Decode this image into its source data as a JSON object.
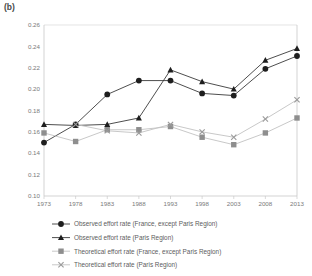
{
  "figure": {
    "panel_label": "(b)"
  },
  "chart_data": {
    "type": "line",
    "title": "",
    "subtitle": "",
    "xlabel": "",
    "ylabel": "",
    "grid": false,
    "legend_position": "bottom",
    "x": [
      1973,
      1978,
      1983,
      1988,
      1993,
      1998,
      2003,
      2008,
      2013
    ],
    "categories": [
      "1973",
      "1978",
      "1983",
      "1988",
      "1993",
      "1998",
      "2003",
      "2008",
      "2013"
    ],
    "xtick_labels": [
      "1973",
      "1978",
      "1983",
      "1988",
      "1993",
      "1998",
      "2003",
      "2008",
      "2013"
    ],
    "ytick_labels": [
      "0.26",
      "0.24",
      "0.22",
      "0.20",
      "0.18",
      "0.16",
      "0.14",
      "0.12",
      "0.10"
    ],
    "ytick_values": [
      0.26,
      0.24,
      0.22,
      0.2,
      0.18,
      0.16,
      0.14,
      0.12,
      0.1
    ],
    "ylim": [
      0.1,
      0.26
    ],
    "xlim": [
      1973,
      2013
    ],
    "series": [
      {
        "name": "Observed effort rate (France, except Paris Region)",
        "marker": "circle",
        "color": "#1e1e1e",
        "line_color": "#3a3a3a",
        "values": [
          0.15,
          0.167,
          0.195,
          0.208,
          0.208,
          0.196,
          0.194,
          0.219,
          0.231
        ]
      },
      {
        "name": "Observed effort rate (Paris Region)",
        "marker": "triangle",
        "color": "#1e1e1e",
        "line_color": "#3a3a3a",
        "values": [
          0.167,
          0.166,
          0.167,
          0.173,
          0.218,
          0.207,
          0.2,
          0.227,
          0.238
        ]
      },
      {
        "name": "Theoretical effort rate (France, except Paris Region)",
        "marker": "square",
        "color": "#8e8e8e",
        "line_color": "#c2c2c2",
        "values": [
          0.159,
          0.151,
          0.162,
          0.162,
          0.165,
          0.155,
          0.148,
          0.159,
          0.173
        ]
      },
      {
        "name": "Theoretical effort rate (Paris Region)",
        "marker": "cross",
        "color": "#9a9a9a",
        "line_color": "#c2c2c2",
        "values": [
          null,
          0.167,
          0.161,
          0.159,
          0.167,
          0.16,
          0.155,
          0.172,
          0.19
        ]
      }
    ]
  },
  "legend": {
    "items": [
      {
        "label": "Observed effort rate (France, except Paris Region)",
        "marker": "circle"
      },
      {
        "label": "Observed effort rate (Paris Region)",
        "marker": "triangle"
      },
      {
        "label": "Theoretical effort rate (France, except Paris Region)",
        "marker": "square"
      },
      {
        "label": "Theoretical effort rate (Paris Region)",
        "marker": "cross"
      }
    ]
  }
}
